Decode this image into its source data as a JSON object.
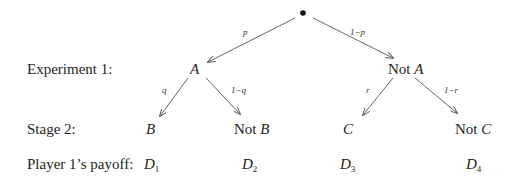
{
  "diagram": {
    "type": "decision-tree",
    "root": {
      "symbol": "•"
    },
    "row_labels": {
      "experiment": "Experiment 1:",
      "stage": "Stage 2:",
      "payoff": "Player 1’s payoff:"
    },
    "level1": {
      "left": {
        "prefix": "",
        "var": "A",
        "prob": "p"
      },
      "right": {
        "prefix": "Not ",
        "var": "A",
        "prob": "1−p"
      }
    },
    "level2": [
      {
        "prefix": "",
        "var": "B",
        "prob": "q"
      },
      {
        "prefix": "Not ",
        "var": "B",
        "prob": "1−q"
      },
      {
        "prefix": "",
        "var": "C",
        "prob": "r"
      },
      {
        "prefix": "Not ",
        "var": "C",
        "prob": "1−r"
      }
    ],
    "payoffs": [
      {
        "var": "D",
        "sub": "1"
      },
      {
        "var": "D",
        "sub": "2"
      },
      {
        "var": "D",
        "sub": "3"
      },
      {
        "var": "D",
        "sub": "4"
      }
    ],
    "colors": {
      "ink": "#231f20",
      "arrow": "#555555"
    }
  }
}
